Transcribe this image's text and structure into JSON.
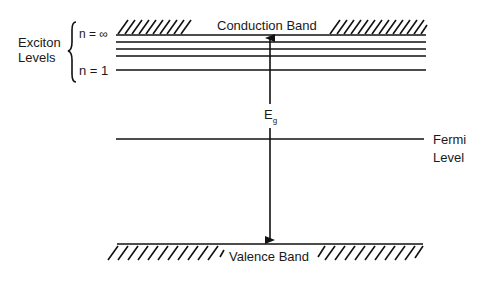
{
  "diagram": {
    "conduction_band": {
      "label": "Conduction Band"
    },
    "valence_band": {
      "label": "Valence Band"
    },
    "exciton": {
      "group_label_line1": "Exciton",
      "group_label_line2": "Levels",
      "n_inf_label": "n = ∞",
      "n_1_label": "n = 1",
      "levels_count": 5
    },
    "band_gap": {
      "symbol": "E",
      "subscript": "g"
    },
    "fermi_level": {
      "label_line1": "Fermi",
      "label_line2": "Level"
    },
    "colors": {
      "line": "#111111",
      "background": "#ffffff"
    }
  }
}
